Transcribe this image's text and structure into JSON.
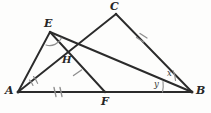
{
  "figure": {
    "type": "geometry-diagram",
    "width": 211,
    "height": 113,
    "background_color": "#fdfdfc",
    "stroke_color": "#2b2b2b",
    "mark_color": "#8c8c8c"
  },
  "points": [
    {
      "id": "A",
      "label": "A",
      "x": 18,
      "y": 92,
      "label_x": 5,
      "label_y": 85
    },
    {
      "id": "B",
      "label": "B",
      "x": 192,
      "y": 92,
      "label_x": 196,
      "label_y": 85
    },
    {
      "id": "C",
      "label": "C",
      "x": 116,
      "y": 14,
      "label_x": 110,
      "label_y": 1
    },
    {
      "id": "E",
      "label": "E",
      "x": 50,
      "y": 32,
      "label_x": 44,
      "label_y": 18
    },
    {
      "id": "F",
      "label": "F",
      "x": 105,
      "y": 92,
      "label_x": 101,
      "label_y": 96
    },
    {
      "id": "H",
      "label": "H",
      "x": 68,
      "y": 65,
      "label_x": 62,
      "label_y": 55
    }
  ],
  "segments": [
    {
      "id": "AB",
      "from": "A",
      "to": "B",
      "name": "base-line-ab"
    },
    {
      "id": "AC",
      "from": "A",
      "to": "C",
      "name": "cevian-ac"
    },
    {
      "id": "AE",
      "from": "A",
      "to": "E",
      "name": "segment-ae"
    },
    {
      "id": "CB",
      "from": "C",
      "to": "B",
      "name": "segment-cb"
    },
    {
      "id": "EF",
      "from": "E",
      "to": "F",
      "name": "cevian-ef"
    },
    {
      "id": "EB",
      "from": "E",
      "to": "B",
      "name": "segment-eb"
    }
  ],
  "angle_labels": [
    {
      "id": "x",
      "text": "x",
      "x": 167,
      "y": 69,
      "vertex": "B",
      "name": "angle-label-x"
    },
    {
      "id": "y",
      "text": "y",
      "x": 154,
      "y": 80,
      "vertex": "B",
      "name": "angle-label-y"
    }
  ],
  "angle_arcs": [
    {
      "id": "arc-A",
      "vertex": "A",
      "name": "angle-arc-at-a"
    },
    {
      "id": "arc-E",
      "vertex": "E",
      "name": "angle-arc-at-e"
    },
    {
      "id": "arc-B-x",
      "vertex": "B",
      "name": "angle-arc-b-x"
    },
    {
      "id": "arc-B-y",
      "vertex": "B",
      "name": "angle-arc-b-y"
    }
  ],
  "tick_marks": [
    {
      "id": "tick-AF",
      "on": "AB",
      "count": 2,
      "name": "tick-marks-segment-af"
    },
    {
      "id": "tick-CB",
      "on": "CB",
      "count": 2,
      "name": "tick-marks-segment-cb"
    },
    {
      "id": "tick-EF",
      "on": "EF",
      "count": 1,
      "name": "tick-mark-segment-ef"
    }
  ]
}
